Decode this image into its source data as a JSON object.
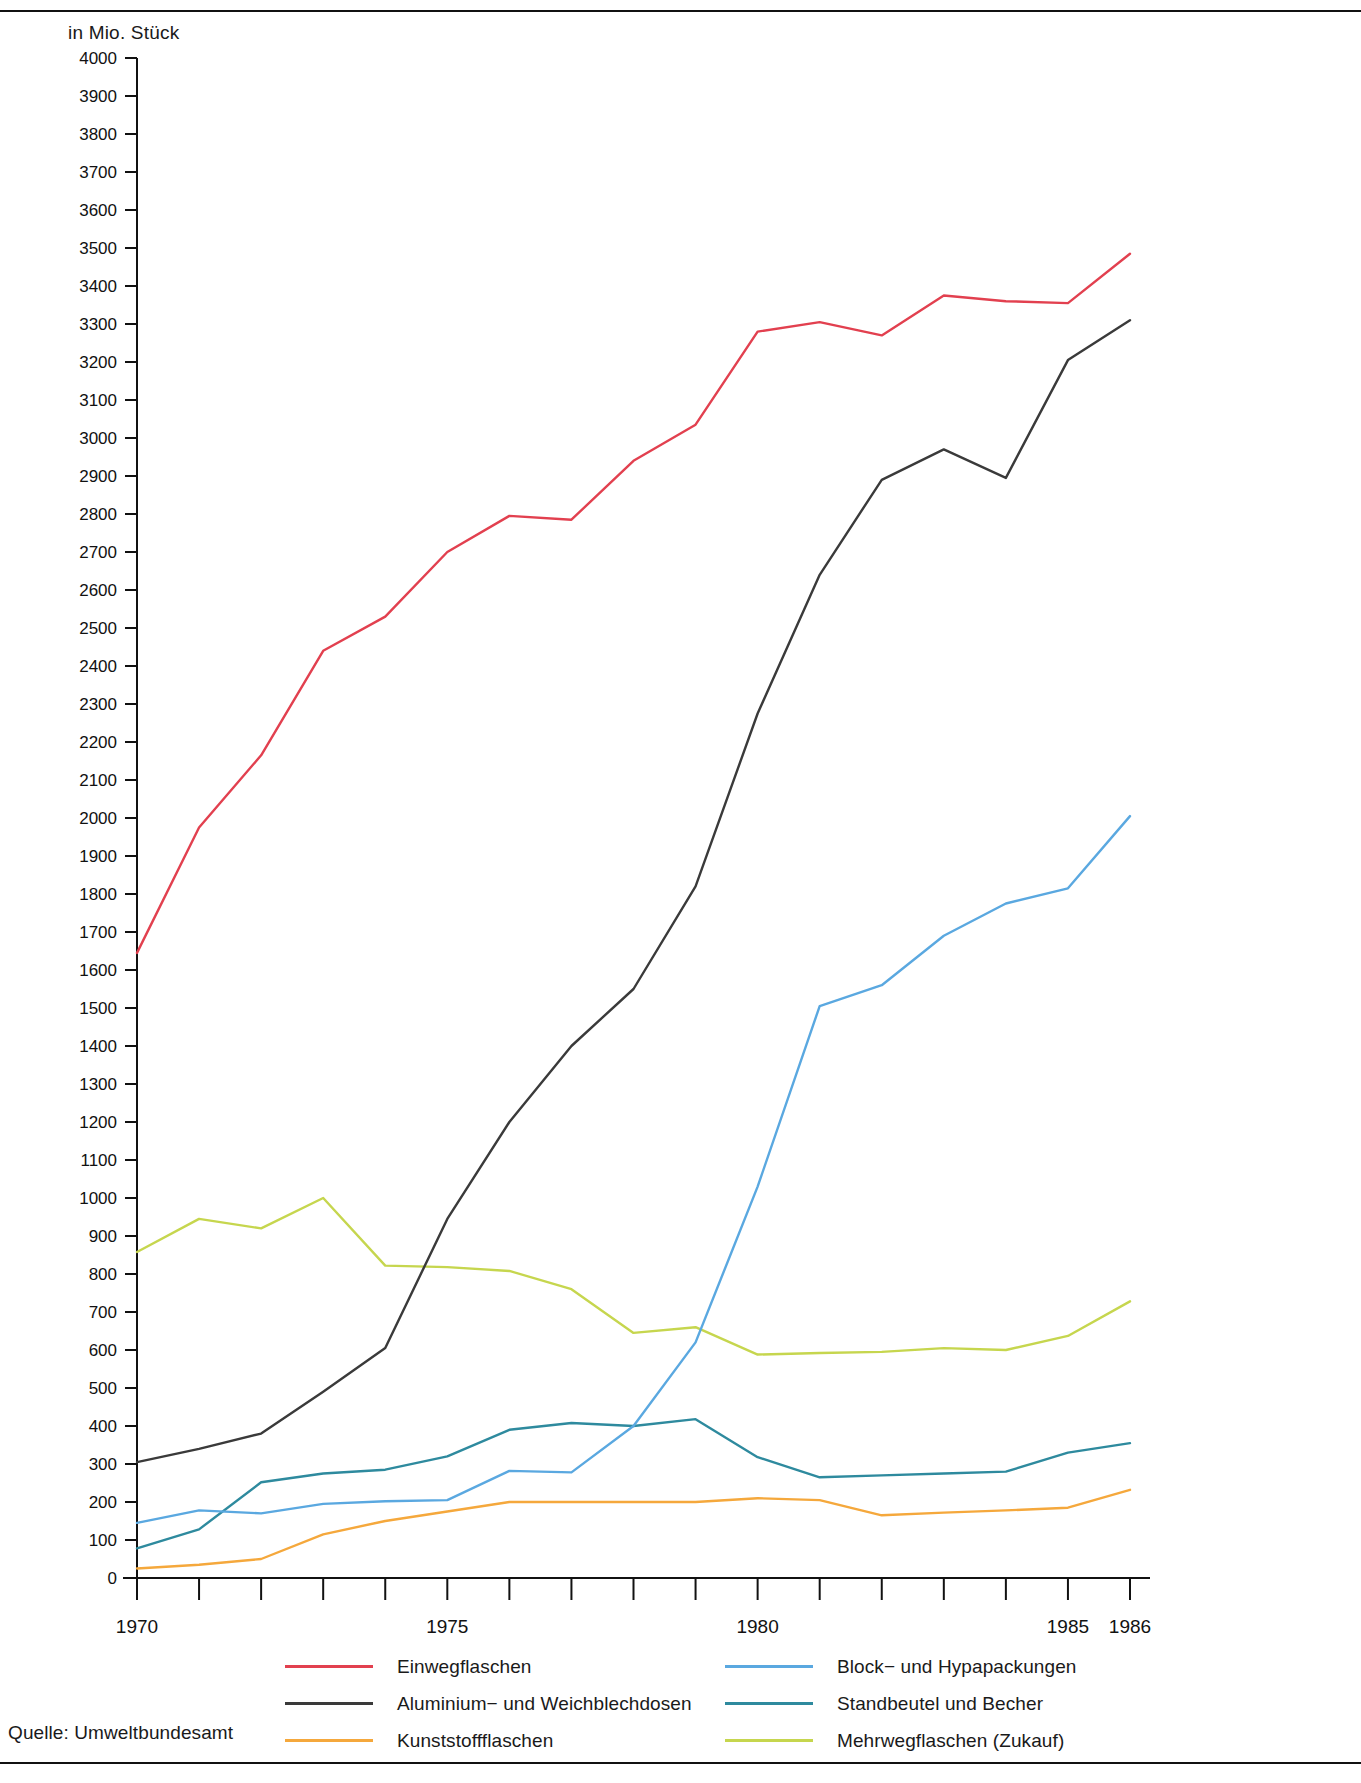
{
  "unit_label": "in Mio. Stück",
  "source_label": "Quelle:  Umweltbundesamt",
  "legend": {
    "left": [
      {
        "label": "Einwegflaschen",
        "color": "#e2404f"
      },
      {
        "label": "Aluminium− und Weichblechdosen",
        "color": "#3a3a3a"
      },
      {
        "label": "Kunststoffflaschen",
        "color": "#f5a83c"
      }
    ],
    "right": [
      {
        "label": "Block− und Hypapackungen",
        "color": "#5aa8e0"
      },
      {
        "label": "Standbeutel und Becher",
        "color": "#2e8a9e"
      },
      {
        "label": "Mehrwegflaschen (Zukauf)",
        "color": "#c6d64e"
      }
    ]
  },
  "chart_data": {
    "type": "line",
    "title": "",
    "xlabel": "",
    "ylabel": "in Mio. Stück",
    "ylim": [
      0,
      4000
    ],
    "ytick_step": 100,
    "grid": false,
    "legend_position": "bottom",
    "x": [
      1970,
      1971,
      1972,
      1973,
      1974,
      1975,
      1976,
      1977,
      1978,
      1979,
      1980,
      1981,
      1982,
      1983,
      1984,
      1985,
      1986
    ],
    "xtick_labels": [
      "1970",
      "1975",
      "1980",
      "1985",
      "1986"
    ],
    "xtick_values": [
      1970,
      1975,
      1980,
      1985,
      1986
    ],
    "ytick_labels": [
      "0",
      "100",
      "200",
      "300",
      "400",
      "500",
      "600",
      "700",
      "800",
      "900",
      "1000",
      "1100",
      "1200",
      "1300",
      "1400",
      "1500",
      "1600",
      "1700",
      "1800",
      "1900",
      "2000",
      "2100",
      "2200",
      "2300",
      "2400",
      "2500",
      "2600",
      "2700",
      "2800",
      "2900",
      "3000",
      "3100",
      "3200",
      "3300",
      "3400",
      "3500",
      "3600",
      "3700",
      "3800",
      "3900",
      "4000"
    ],
    "series": [
      {
        "name": "Einwegflaschen",
        "color": "#e2404f",
        "values": [
          1645,
          1975,
          2165,
          2440,
          2530,
          2700,
          2795,
          2785,
          2940,
          3035,
          3280,
          3305,
          3270,
          3375,
          3360,
          3355,
          3485
        ]
      },
      {
        "name": "Aluminium− und Weichblechdosen",
        "color": "#3a3a3a",
        "values": [
          305,
          340,
          380,
          490,
          605,
          945,
          1200,
          1400,
          1550,
          1820,
          2275,
          2640,
          2890,
          2970,
          2895,
          3205,
          3310
        ]
      },
      {
        "name": "Kunststoffflaschen",
        "color": "#f5a83c",
        "values": [
          25,
          35,
          50,
          115,
          150,
          175,
          200,
          200,
          200,
          200,
          210,
          205,
          165,
          172,
          178,
          185,
          232
        ]
      },
      {
        "name": "Block− und Hypapackungen",
        "color": "#5aa8e0",
        "values": [
          145,
          178,
          170,
          195,
          202,
          205,
          282,
          278,
          400,
          620,
          1030,
          1505,
          1560,
          1690,
          1775,
          1815,
          2005
        ]
      },
      {
        "name": "Standbeutel und Becher",
        "color": "#2e8a9e",
        "values": [
          78,
          128,
          252,
          275,
          285,
          320,
          390,
          408,
          400,
          418,
          318,
          265,
          270,
          275,
          280,
          330,
          355
        ]
      },
      {
        "name": "Mehrwegflaschen (Zukauf)",
        "color": "#c6d64e",
        "values": [
          858,
          945,
          920,
          1000,
          822,
          818,
          808,
          760,
          645,
          660,
          588,
          592,
          595,
          605,
          600,
          637,
          728
        ]
      }
    ]
  }
}
